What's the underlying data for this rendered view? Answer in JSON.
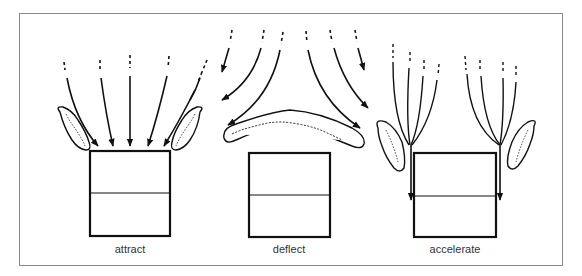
{
  "diagram": {
    "panels": [
      {
        "id": "attract",
        "label": "attract",
        "description": "Airflow lines converge toward box between two angled shrubs"
      },
      {
        "id": "deflect",
        "label": "deflect",
        "description": "Curved windbreak above box deflects airflow around it"
      },
      {
        "id": "accelerate",
        "label": "accelerate",
        "description": "Airflow funneled and accelerated down both sides of box past shrubs"
      }
    ],
    "colors": {
      "line": "#111111",
      "frame": "#8a8a8a",
      "label": "#333333",
      "background": "#ffffff"
    }
  }
}
